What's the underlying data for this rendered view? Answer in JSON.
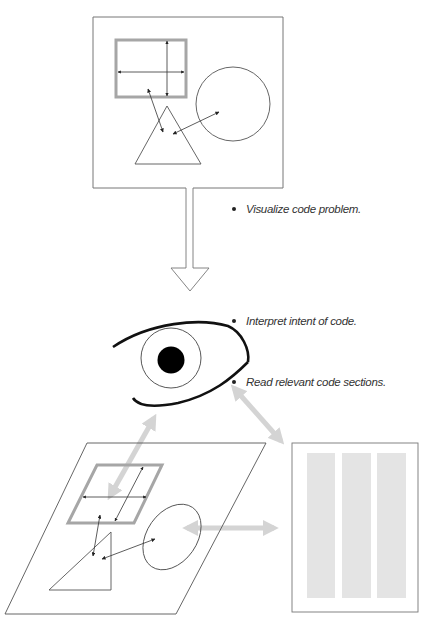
{
  "diagram": {
    "type": "process-illustration",
    "colors": {
      "stroke": "#555555",
      "frame_stroke": "#888888",
      "highlight_rect": "#999999",
      "gray_arrow": "#d4d4d4",
      "code_column": "#e2e2e2",
      "eye_stroke": "#111111",
      "pupil": "#000000"
    },
    "stages": [
      {
        "id": "mental-model",
        "description": "Square frame containing a gray-bordered rectangle, a circle and a triangle linked by arrows"
      },
      {
        "id": "down-arrow",
        "description": "Hollow arrow pointing downward"
      },
      {
        "id": "eye",
        "description": "Stylized eye with circle iris and black pupil"
      },
      {
        "id": "perspective-plane",
        "description": "Parallelogram plane with skewed rectangle, ellipse and triangle"
      },
      {
        "id": "code-document",
        "description": "Document with three gray columns of code"
      }
    ],
    "labels": [
      {
        "text": "Visualize code problem."
      },
      {
        "text": "Interpret intent of code."
      },
      {
        "text": "Read relevant code sections."
      }
    ]
  }
}
